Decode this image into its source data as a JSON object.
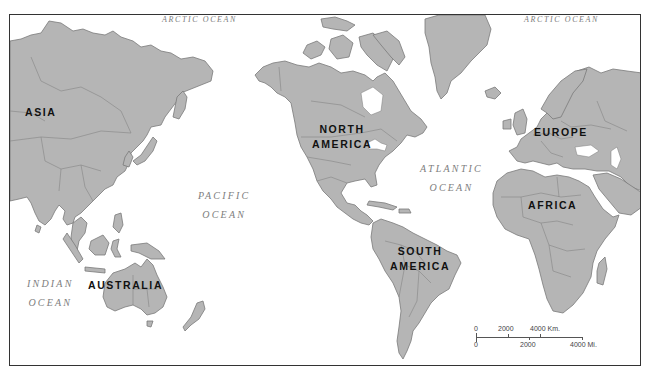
{
  "map": {
    "land_color": "#b5b5b5",
    "border_color": "#7a7a7a",
    "water_color": "#ffffff",
    "frame_color": "#333333"
  },
  "continents": [
    {
      "id": "asia",
      "label": "ASIA"
    },
    {
      "id": "north-america",
      "line1": "NORTH",
      "line2": "AMERICA"
    },
    {
      "id": "europe",
      "label": "EUROPE"
    },
    {
      "id": "africa",
      "label": "AFRICA"
    },
    {
      "id": "south-america",
      "line1": "SOUTH",
      "line2": "AMERICA"
    },
    {
      "id": "australia",
      "label": "AUSTRALIA"
    }
  ],
  "oceans": [
    {
      "id": "arctic-west",
      "label": "ARCTIC OCEAN"
    },
    {
      "id": "arctic-east",
      "label": "ARCTIC OCEAN"
    },
    {
      "id": "pacific",
      "line1": "PACIFIC",
      "line2": "OCEAN"
    },
    {
      "id": "atlantic",
      "line1": "ATLANTIC",
      "line2": "OCEAN"
    },
    {
      "id": "indian",
      "line1": "INDIAN",
      "line2": "OCEAN"
    }
  ],
  "scale_bar": {
    "km_labels": [
      "0",
      "2000",
      "4000 Km."
    ],
    "mi_labels": [
      "0",
      "2000",
      "4000 Mi."
    ]
  }
}
